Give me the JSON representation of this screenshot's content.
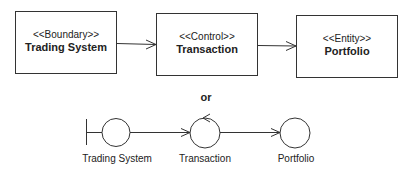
{
  "diagram": {
    "type": "uml-robustness",
    "top_row": {
      "boxes": [
        {
          "stereotype": "<<Boundary>>",
          "name": "Trading System"
        },
        {
          "stereotype": "<<Control>>",
          "name": "Transaction"
        },
        {
          "stereotype": "<<Entity>>",
          "name": "Portfolio"
        }
      ],
      "edges": [
        {
          "from": "Trading System",
          "to": "Transaction"
        },
        {
          "from": "Transaction",
          "to": "Portfolio"
        }
      ]
    },
    "separator_label": "or",
    "bottom_row": {
      "icons": [
        {
          "kind": "boundary",
          "label": "Trading System"
        },
        {
          "kind": "control",
          "label": "Transaction"
        },
        {
          "kind": "entity",
          "label": "Portfolio"
        }
      ],
      "edges": [
        {
          "from": "Trading System",
          "to": "Transaction"
        },
        {
          "from": "Transaction",
          "to": "Portfolio"
        }
      ]
    }
  }
}
